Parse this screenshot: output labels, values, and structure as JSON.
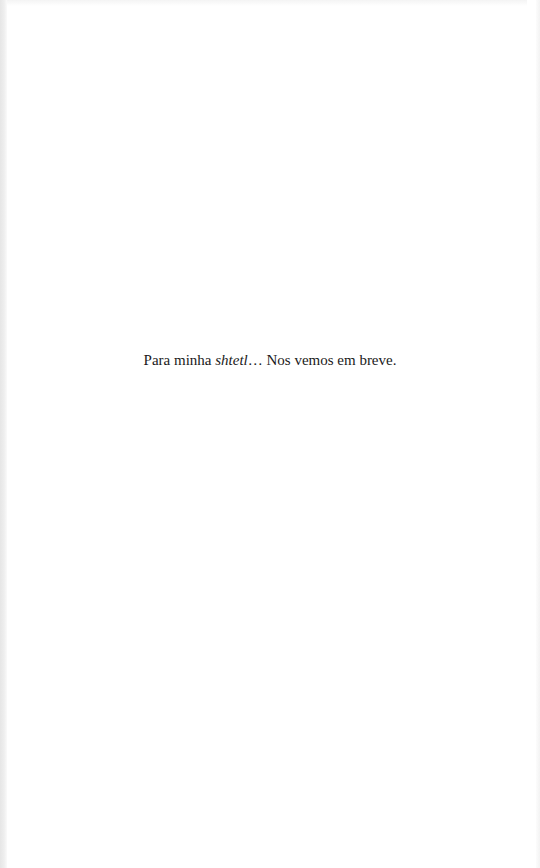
{
  "page": {
    "type": "dedication",
    "background_color": "#ffffff",
    "text_color": "#1a1a1a"
  },
  "dedication": {
    "prefix": "Para minha ",
    "italic_word": "shtetl",
    "ellipsis": "…",
    "suffix": " Nos vemos em breve."
  }
}
